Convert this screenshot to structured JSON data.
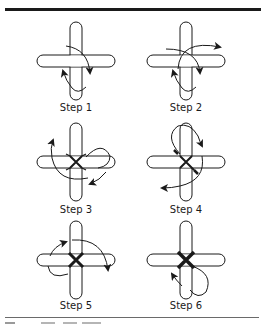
{
  "figure": {
    "colors": {
      "ink": "#1a1a1a",
      "rule": "#1a1a1a",
      "bottom_rule": "#6a6a6a",
      "background": "#ffffff"
    },
    "steps": [
      {
        "label": "Step 1"
      },
      {
        "label": "Step 2"
      },
      {
        "label": "Step 3"
      },
      {
        "label": "Step 4"
      },
      {
        "label": "Step 5"
      },
      {
        "label": "Step 6"
      }
    ]
  }
}
